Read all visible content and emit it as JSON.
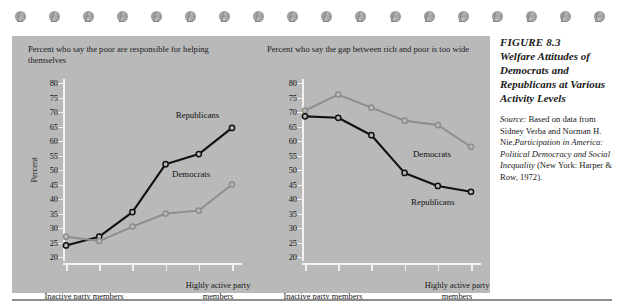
{
  "ornaments": {
    "icon": "floral-ornament",
    "count": 18
  },
  "figure": {
    "number": "FIGURE 8.3",
    "caption": "Welfare Attitudes of Democrats and Republicans at Various Activity Levels",
    "source_lead": "Source:",
    "source_text_1": " Based on data from Sidney Verba and Norman H. Nie,",
    "source_title": "Participation in America: Political Democracy and Social Inequality",
    "source_text_2": " (New York: Harper & Row, 1972)."
  },
  "colors": {
    "panel_background": "#b9b9b9",
    "republicans_line": "#111111",
    "democrats_line": "#8d8d8d",
    "axis": "#f2f2f2",
    "page_background": "#ffffff"
  },
  "axis": {
    "y_label": "Percent",
    "y_ticks": [
      80,
      75,
      70,
      65,
      60,
      55,
      50,
      45,
      40,
      35,
      30,
      25,
      20
    ],
    "y_min": 20,
    "y_max": 80,
    "x_caption_left": "Inactive party members",
    "x_caption_right": "Highly active party members",
    "x_tick_count": 6
  },
  "chart_data": [
    {
      "type": "line",
      "title": "Percent who say the poor are responsible for helping themselves",
      "xlabel": "",
      "ylabel": "Percent",
      "ylim": [
        20,
        80
      ],
      "grid": false,
      "categories": [
        "1",
        "2",
        "3",
        "4",
        "5",
        "6"
      ],
      "x_tick_labels": [
        "Inactive party members",
        "",
        "",
        "",
        "",
        "Highly active party members"
      ],
      "legend_position": "inline-annotation",
      "series": [
        {
          "name": "Republicans",
          "color": "#111111",
          "marker": "open-circle",
          "values": [
            24,
            27,
            35.5,
            52,
            55.5,
            64.5
          ],
          "label_x_pct": 64,
          "label_y_value": 69
        },
        {
          "name": "Democrats",
          "color": "#8d8d8d",
          "marker": "open-circle",
          "values": [
            27,
            25.5,
            30.5,
            35,
            36,
            45
          ],
          "label_x_pct": 62,
          "label_y_value": 48.5
        }
      ]
    },
    {
      "type": "line",
      "title": "Percent who say the gap between rich and poor is too wide",
      "xlabel": "",
      "ylabel": "",
      "ylim": [
        20,
        80
      ],
      "grid": false,
      "categories": [
        "1",
        "2",
        "3",
        "4",
        "5",
        "6"
      ],
      "x_tick_labels": [
        "Inactive party members",
        "",
        "",
        "",
        "",
        "Highly active party members"
      ],
      "legend_position": "inline-annotation",
      "series": [
        {
          "name": "Democrats",
          "color": "#8d8d8d",
          "marker": "open-circle",
          "values": [
            70.5,
            76,
            71.5,
            67,
            65.5,
            58
          ],
          "label_x_pct": 63,
          "label_y_value": 55.5
        },
        {
          "name": "Republicans",
          "color": "#111111",
          "marker": "open-circle",
          "values": [
            68.5,
            68,
            62,
            49,
            44.5,
            42.5
          ],
          "label_x_pct": 62,
          "label_y_value": 39
        }
      ]
    }
  ]
}
